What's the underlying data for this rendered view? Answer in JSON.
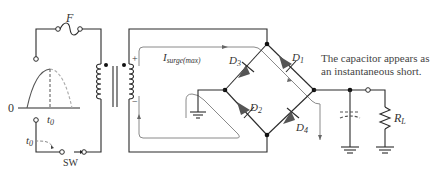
{
  "labels": {
    "fuse": "F",
    "zero": "0",
    "t0_wave": "t",
    "t0_wave_sub": "0",
    "t0_switch": "t",
    "t0_switch_sub": "0",
    "switch": "SW",
    "current_main": "I",
    "current_sub": "surge(max)",
    "plus": "+",
    "minus": "−",
    "d1": "D",
    "d1_sub": "1",
    "d2": "D",
    "d2_sub": "2",
    "d3": "D",
    "d3_sub": "3",
    "d4": "D",
    "d4_sub": "4",
    "load": "R",
    "load_sub": "L"
  },
  "note": {
    "line1": "The capacitor appears as",
    "line2": "an instantaneous short."
  },
  "colors": {
    "wire": "#2b2b2b",
    "current_path": "#8a8a8a",
    "diode": "#555555"
  }
}
